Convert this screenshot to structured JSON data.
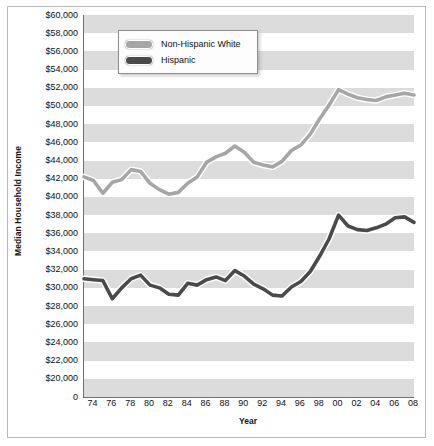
{
  "chart_data": {
    "type": "line",
    "title": "",
    "xlabel": "Year",
    "ylabel": "Median Household Income",
    "ylim": [
      0,
      60000
    ],
    "y_tick_labels": [
      "$60,000",
      "$58,000",
      "$56,000",
      "$54,000",
      "$52,000",
      "$50,000",
      "$48,000",
      "$46,000",
      "$44,000",
      "$42,000",
      "$40,000",
      "$38,000",
      "$36,000",
      "$34,000",
      "$32,000",
      "$30,000",
      "$28,000",
      "$26,000",
      "$24,000",
      "$22,000",
      "$20,000",
      "0"
    ],
    "y_tick_values": [
      60000,
      58000,
      56000,
      54000,
      52000,
      50000,
      48000,
      46000,
      44000,
      42000,
      40000,
      38000,
      36000,
      34000,
      32000,
      30000,
      28000,
      26000,
      24000,
      22000,
      20000,
      0
    ],
    "x_tick_labels": [
      "74",
      "76",
      "78",
      "80",
      "82",
      "84",
      "86",
      "88",
      "90",
      "92",
      "94",
      "96",
      "98",
      "00",
      "02",
      "04",
      "06",
      "08"
    ],
    "x": [
      1973,
      1974,
      1975,
      1976,
      1977,
      1978,
      1979,
      1980,
      1981,
      1982,
      1983,
      1984,
      1985,
      1986,
      1987,
      1988,
      1989,
      1990,
      1991,
      1992,
      1993,
      1994,
      1995,
      1996,
      1997,
      1998,
      1999,
      2000,
      2001,
      2002,
      2003,
      2004,
      2005,
      2006,
      2007,
      2008
    ],
    "xlim": [
      1973,
      2008
    ],
    "grid": "horizontal-bands",
    "legend_position": "top-left-inside",
    "series": [
      {
        "name": "Non-Hispanic White",
        "color": "#a6a6a6",
        "values": [
          42200,
          41800,
          40400,
          41600,
          41900,
          43000,
          42800,
          41500,
          40800,
          40300,
          40500,
          41500,
          42200,
          43800,
          44400,
          44800,
          45600,
          44900,
          43800,
          43500,
          43300,
          43900,
          45100,
          45700,
          46900,
          48600,
          50100,
          51800,
          51300,
          50900,
          50700,
          50600,
          51000,
          51200,
          51400,
          51200
        ]
      },
      {
        "name": "Hispanic",
        "color": "#4a4a4a",
        "values": [
          31000,
          30900,
          30800,
          28800,
          30000,
          31000,
          31400,
          30300,
          30000,
          29300,
          29200,
          30500,
          30300,
          30900,
          31200,
          30800,
          31900,
          31300,
          30400,
          29900,
          29200,
          29100,
          30100,
          30700,
          31800,
          33500,
          35400,
          38000,
          36800,
          36400,
          36300,
          36600,
          37000,
          37700,
          37800,
          37200
        ]
      }
    ]
  },
  "legend": {
    "entries": [
      {
        "label": "Non-Hispanic White"
      },
      {
        "label": "Hispanic"
      }
    ]
  }
}
